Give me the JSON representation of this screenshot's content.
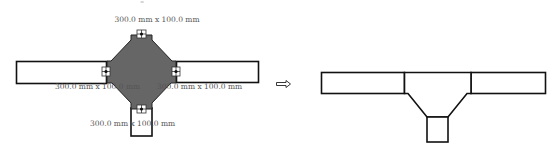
{
  "colors": {
    "stroke": "#111111",
    "fitting_fill": "#666666",
    "background": "#ffffff",
    "text": "#555555"
  },
  "before": {
    "description": "Four-way cross fitting with connector grips",
    "labels": {
      "top": "300.0 mm x 100.0 mm",
      "left": "300.0 mm x 100.0 mm",
      "right": "300.0 mm x 100.0 mm",
      "bottom": "300.0 mm x 100.0 mm"
    },
    "top_mark": "–"
  },
  "arrow": {
    "icon": "right-outline-arrow-icon",
    "glyph": "⇨"
  },
  "after": {
    "description": "Tee fitting with three connected segments"
  }
}
